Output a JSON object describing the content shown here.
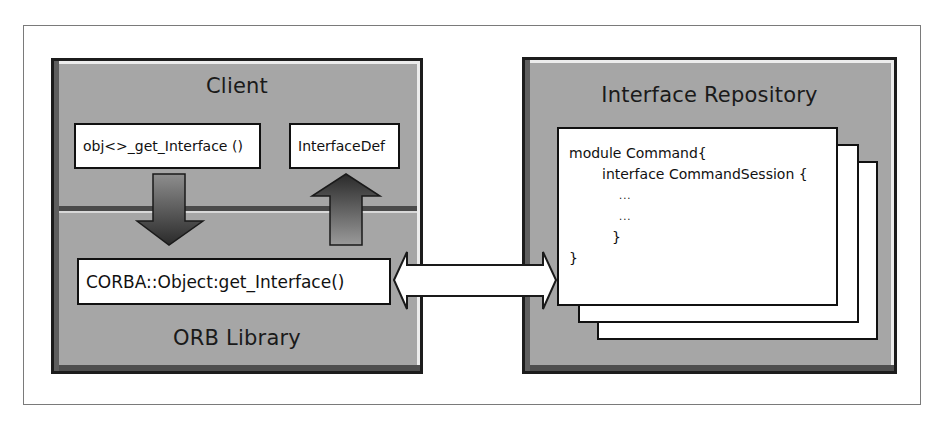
{
  "diagram": {
    "client_panel": {
      "title": "Client",
      "call_box": "obj<>_get_Interface ()",
      "result_box": "InterfaceDef",
      "orb_box": "CORBA::Object:get_Interface()",
      "orb_title": "ORB Library"
    },
    "repository_panel": {
      "title": "Interface Repository",
      "code_lines": [
        "module Command{",
        "interface CommandSession {",
        "...",
        "...",
        "}",
        "}"
      ]
    },
    "arrows": [
      {
        "name": "request-down-arrow",
        "from": "obj<>_get_Interface ()",
        "to": "CORBA::Object:get_Interface()"
      },
      {
        "name": "result-up-arrow",
        "from": "CORBA::Object:get_Interface()",
        "to": "InterfaceDef"
      },
      {
        "name": "lookup-double-arrow",
        "from": "CORBA::Object:get_Interface()",
        "to": "Interface Repository"
      }
    ],
    "colors": {
      "panel_fill": "#a6a6a6",
      "panel_border": "#1c1c1c",
      "box_fill": "#ffffff",
      "arrow_dark": "#2e2e2e",
      "arrow_light": "#a0a0a0"
    }
  }
}
